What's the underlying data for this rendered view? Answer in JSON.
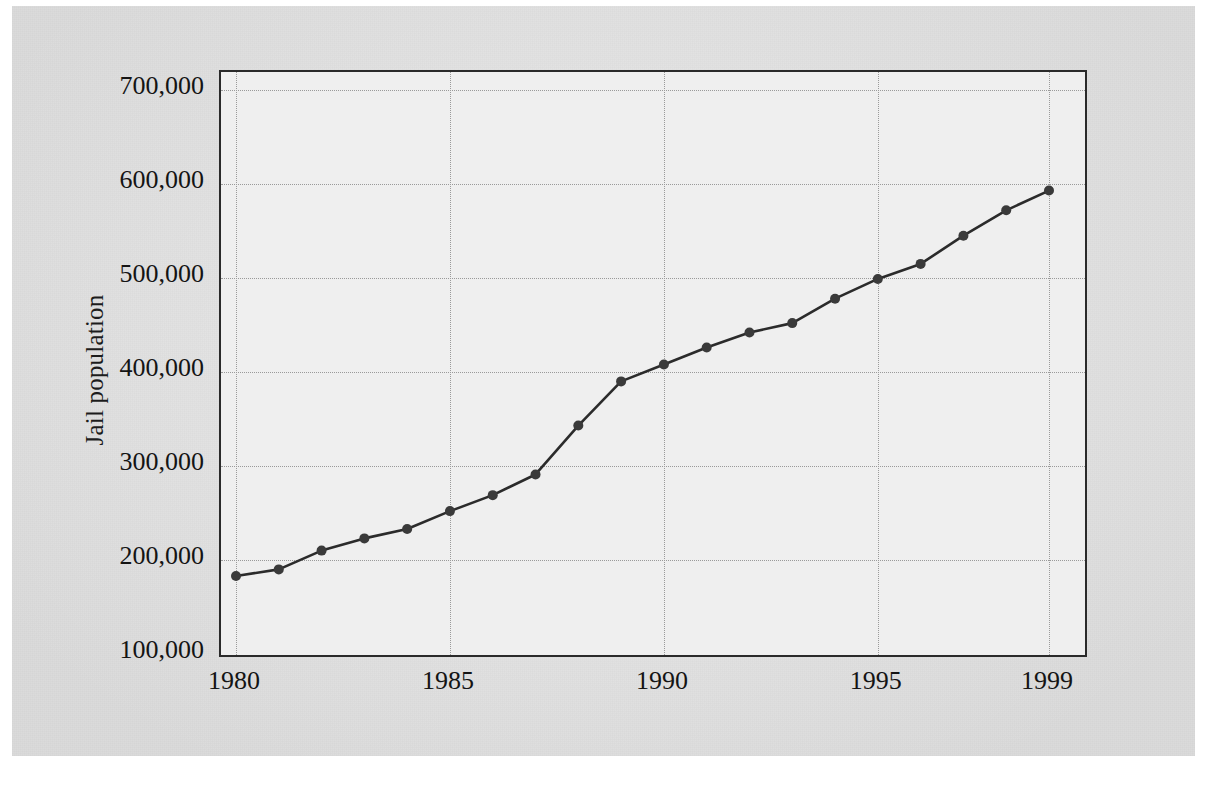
{
  "chart_data": {
    "type": "line",
    "title": "",
    "xlabel": "",
    "ylabel": "Jail population",
    "x": [
      1980,
      1981,
      1982,
      1983,
      1984,
      1985,
      1986,
      1987,
      1988,
      1989,
      1990,
      1991,
      1992,
      1993,
      1994,
      1995,
      1996,
      1997,
      1998,
      1999
    ],
    "values": [
      183000,
      190000,
      210000,
      223000,
      233000,
      252000,
      269000,
      291000,
      343000,
      390000,
      408000,
      426000,
      442000,
      452000,
      478000,
      499000,
      515000,
      545000,
      572000,
      593000
    ],
    "series": [
      {
        "name": "Jail population",
        "values": [
          183000,
          190000,
          210000,
          223000,
          233000,
          252000,
          269000,
          291000,
          343000,
          390000,
          408000,
          426000,
          442000,
          452000,
          478000,
          499000,
          515000,
          545000,
          572000,
          593000
        ]
      }
    ],
    "xlim": [
      1980,
      1999
    ],
    "ylim": [
      100000,
      700000
    ],
    "x_tick_labels": [
      "1980",
      "1985",
      "1990",
      "1995",
      "1999"
    ],
    "x_tick_values": [
      1980,
      1985,
      1990,
      1995,
      1999
    ],
    "y_tick_labels": [
      "100,000",
      "200,000",
      "300,000",
      "400,000",
      "500,000",
      "600,000",
      "700,000"
    ],
    "y_tick_values": [
      100000,
      200000,
      300000,
      400000,
      500000,
      600000,
      700000
    ],
    "grid": true,
    "legend": "none",
    "marker": "circle",
    "line_color": "#2b2b2b",
    "marker_color": "#3a3a3a",
    "grid_color": "#9a9a9a",
    "plot_bg": "#efefef",
    "page_bg": "#e3e3e3",
    "annotations": []
  }
}
